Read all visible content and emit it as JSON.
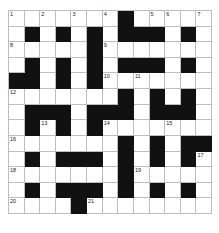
{
  "puzzle": {
    "title": "",
    "rows": 13,
    "cols": 13,
    "layout": [
      "W.W.W.W#WWW.W",
      "W#W#W#W###W#W",
      "WWWWW#WWWWWWW",
      "W#W#W#W###W#W",
      "##W#W#WWWWWWW",
      "WWWWWWW#W#W#W",
      "W###W###W###W",
      "W#W#W#WWWWWWW",
      "WWWWWWW#W#W##",
      "W#W###W#W#W#W",
      "WWWWWWW#WWWWW",
      "W#W###W#W#W#W",
      "WWWW#WWWWWWWW"
    ],
    "numbers": [
      {
        "r": 0,
        "c": 0,
        "n": "1"
      },
      {
        "r": 0,
        "c": 2,
        "n": "2"
      },
      {
        "r": 0,
        "c": 4,
        "n": "3"
      },
      {
        "r": 0,
        "c": 6,
        "n": "4"
      },
      {
        "r": 0,
        "c": 9,
        "n": "5"
      },
      {
        "r": 0,
        "c": 10,
        "n": "6"
      },
      {
        "r": 0,
        "c": 12,
        "n": "7"
      },
      {
        "r": 2,
        "c": 0,
        "n": "8"
      },
      {
        "r": 2,
        "c": 6,
        "n": "9"
      },
      {
        "r": 4,
        "c": 6,
        "n": "10"
      },
      {
        "r": 4,
        "c": 8,
        "n": "11"
      },
      {
        "r": 5,
        "c": 0,
        "n": "12"
      },
      {
        "r": 7,
        "c": 2,
        "n": "13"
      },
      {
        "r": 7,
        "c": 6,
        "n": "14"
      },
      {
        "r": 7,
        "c": 10,
        "n": "15"
      },
      {
        "r": 8,
        "c": 0,
        "n": "16"
      },
      {
        "r": 9,
        "c": 12,
        "n": "17"
      },
      {
        "r": 10,
        "c": 0,
        "n": "18"
      },
      {
        "r": 10,
        "c": 8,
        "n": "19"
      },
      {
        "r": 12,
        "c": 0,
        "n": "20"
      },
      {
        "r": 12,
        "c": 5,
        "n": "21"
      }
    ],
    "colors": {
      "black": "#111111",
      "white": "#ffffff",
      "line": "#bdbdbd"
    }
  }
}
